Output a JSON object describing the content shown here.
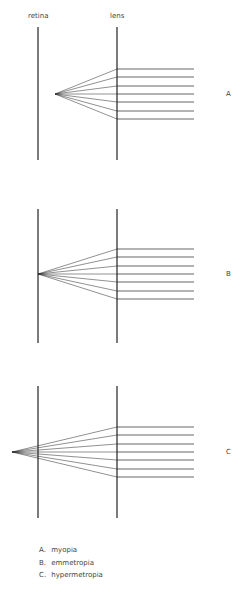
{
  "headers": {
    "retina": "retina",
    "lens": "lens"
  },
  "panels": [
    {
      "id": "A",
      "label": "A",
      "focus_x": 55,
      "top": 27,
      "bottom": 160,
      "axis_y": 94
    },
    {
      "id": "B",
      "label": "B",
      "focus_x": 38,
      "top": 209,
      "bottom": 343,
      "axis_y": 274
    },
    {
      "id": "C",
      "label": "C",
      "focus_x": 12,
      "top": 386,
      "bottom": 518,
      "axis_y": 452
    }
  ],
  "geometry": {
    "retina_x": 38,
    "lens_x": 117,
    "ray_end_x": 194,
    "ray_offsets": [
      -25,
      -17,
      -8,
      0,
      8,
      17,
      25
    ]
  },
  "legend": [
    {
      "key": "A.",
      "text": "myopia"
    },
    {
      "key": "B.",
      "text": "emmetropia"
    },
    {
      "key": "C.",
      "text": "hypermetropia"
    }
  ]
}
